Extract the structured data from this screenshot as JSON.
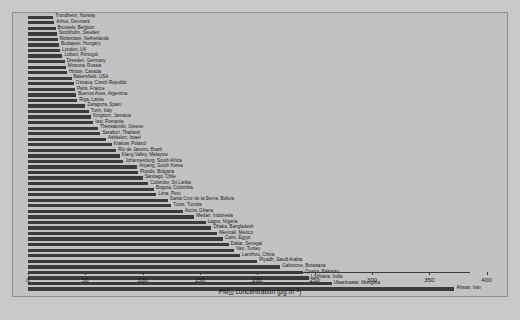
{
  "chart_data": {
    "type": "bar",
    "orientation": "horizontal",
    "title": "",
    "xlabel": "PM10 concentration (µg m−3)",
    "ylabel": "",
    "xlim": [
      0,
      410
    ],
    "grid": false,
    "legend": null,
    "bar_color": "#3b3b3b",
    "background_color": "#c2c2c2",
    "xticks": [
      0,
      50,
      100,
      150,
      200,
      250,
      300,
      350,
      400
    ],
    "xtick_labels": [
      "0",
      "50",
      "100",
      "150",
      "200",
      "250",
      "300",
      "350",
      "400"
    ],
    "categories": [
      "Trondheim, Norway",
      "Arhus, Denmark",
      "Brussels, Belgium",
      "Stockholm, Sweden",
      "Rotterdam, Netherlands",
      "Budapest, Hungary",
      "London, UK",
      "Lisbon, Portugal",
      "Dresden, Germany",
      "Moscow, Russia",
      "Hinton, Canada",
      "Bakersfield, USA",
      "Ostrava, Czech Republic",
      "Paris, France",
      "Buenos Aires, Argentina",
      "Riga, Latvia",
      "Zaragoza, Spain",
      "Turin, Italy",
      "Kingston, Jamaica",
      "Iasi, Romania",
      "Thessaloniki, Greece",
      "Saraburi, Thailand",
      "Ashkelon, Israel",
      "Krakow, Poland",
      "Rio de Janeiro, Brazil",
      "Klang Valley, Malaysia",
      "Johannesburg, South Africa",
      "Anyang, South Korea",
      "Plovdiv, Bulgaria",
      "Santiago, Chile",
      "Colombo, Sri Lanka",
      "Bogota, Colombia",
      "Lima, Peru",
      "Santa Cruz de la Sierra, Bolivia",
      "Tunis, Tunisia",
      "Accra, Ghana",
      "Medan, Indonesia",
      "Lagos, Nigeria",
      "Dhaka, Bangladesh",
      "Mexicali, Mexico",
      "Cairo, Egypt",
      "Dakar, Senegal",
      "Van, Turkey",
      "Lanzhou, China",
      "Riyadh, Saudi Arabia",
      "Gaborone, Botswana",
      "Quetta, Pakistan",
      "Ludhiana, India",
      "Ulaanbaatar, Mongolia",
      "Ahwaz, Iran"
    ],
    "values": [
      22,
      23,
      24,
      25,
      26,
      27,
      28,
      30,
      32,
      33,
      34,
      38,
      40,
      41,
      42,
      43,
      50,
      53,
      55,
      57,
      61,
      63,
      68,
      73,
      77,
      80,
      83,
      95,
      96,
      100,
      105,
      110,
      112,
      122,
      125,
      135,
      145,
      155,
      160,
      165,
      170,
      175,
      180,
      185,
      200,
      220,
      240,
      245,
      265,
      372
    ]
  },
  "axis": {
    "x_title_main": "PM",
    "x_title_sub": "10",
    "x_title_rest": " concentration (µg m",
    "x_title_sup": "−3",
    "x_title_close": ")"
  }
}
